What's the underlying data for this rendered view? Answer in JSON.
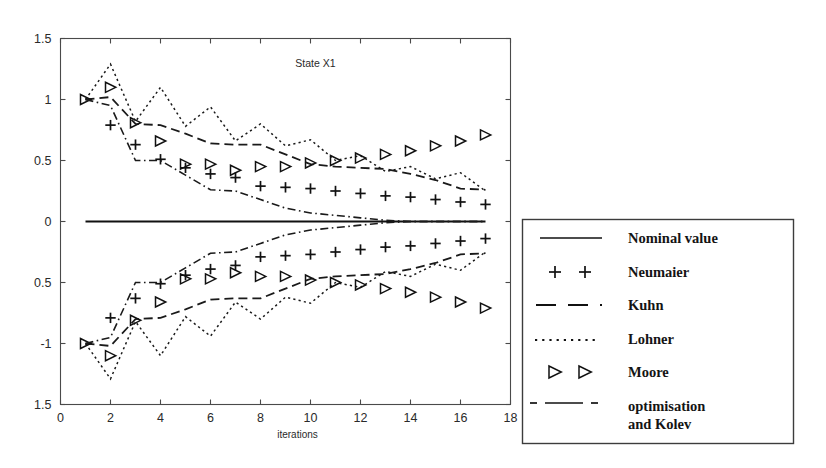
{
  "figure": {
    "title": "State X1",
    "xlabel": "iterations",
    "ylabel": ""
  },
  "chart_data": {
    "type": "line",
    "title": "State X1",
    "xlabel": "iterations",
    "ylabel": "",
    "xlim": [
      0,
      18
    ],
    "ylim": [
      -1.5,
      1.5
    ],
    "xticks": [
      0,
      2,
      4,
      6,
      8,
      10,
      12,
      14,
      16,
      18
    ],
    "xticklabels": [
      "0",
      "2",
      "4",
      "6",
      "8",
      "10",
      "12",
      "14",
      "16",
      "18"
    ],
    "yticks": [
      -1.5,
      -1.0,
      -0.5,
      0,
      0.5,
      1.0,
      1.5
    ],
    "yticklabels": [
      "1.5",
      "-1",
      "0.5",
      "0",
      "0.5",
      "1",
      "1.5"
    ],
    "grid": false,
    "legend_position": "outside-right",
    "x": [
      1,
      2,
      3,
      4,
      5,
      6,
      7,
      8,
      9,
      10,
      11,
      12,
      13,
      14,
      15,
      16,
      17
    ],
    "series": [
      {
        "name": "Nominal value",
        "style": "solid",
        "marker": "none",
        "values": [
          0,
          0,
          0,
          0,
          0,
          0,
          0,
          0,
          0,
          0,
          0,
          0,
          0,
          0,
          0,
          0,
          0
        ]
      },
      {
        "name": "Neumaier",
        "style": "none",
        "marker": "plus",
        "bound": "upper",
        "values": [
          1.0,
          0.79,
          0.63,
          0.51,
          0.44,
          0.39,
          0.36,
          0.29,
          0.28,
          0.27,
          0.25,
          0.23,
          0.21,
          0.2,
          0.18,
          0.16,
          0.14
        ]
      },
      {
        "name": "Neumaier",
        "style": "none",
        "marker": "plus",
        "bound": "lower",
        "values": [
          -1.0,
          -0.79,
          -0.63,
          -0.51,
          -0.44,
          -0.39,
          -0.36,
          -0.29,
          -0.28,
          -0.27,
          -0.25,
          -0.23,
          -0.21,
          -0.2,
          -0.18,
          -0.16,
          -0.14
        ]
      },
      {
        "name": "Kuhn",
        "style": "dashed",
        "marker": "none",
        "bound": "upper",
        "values": [
          1.0,
          1.02,
          0.8,
          0.79,
          0.72,
          0.64,
          0.63,
          0.63,
          0.55,
          0.47,
          0.45,
          0.44,
          0.43,
          0.39,
          0.34,
          0.27,
          0.26
        ]
      },
      {
        "name": "Kuhn",
        "style": "dashed",
        "marker": "none",
        "bound": "lower",
        "values": [
          -1.0,
          -1.02,
          -0.8,
          -0.79,
          -0.72,
          -0.64,
          -0.63,
          -0.63,
          -0.55,
          -0.47,
          -0.45,
          -0.44,
          -0.43,
          -0.39,
          -0.34,
          -0.27,
          -0.26
        ]
      },
      {
        "name": "Lohner",
        "style": "dotted",
        "marker": "none",
        "bound": "upper",
        "values": [
          1.0,
          1.29,
          0.82,
          1.1,
          0.78,
          0.94,
          0.66,
          0.8,
          0.62,
          0.67,
          0.5,
          0.54,
          0.41,
          0.45,
          0.35,
          0.4,
          0.25
        ]
      },
      {
        "name": "Lohner",
        "style": "dotted",
        "marker": "none",
        "bound": "lower",
        "values": [
          -1.0,
          -1.29,
          -0.82,
          -1.1,
          -0.78,
          -0.94,
          -0.66,
          -0.8,
          -0.62,
          -0.67,
          -0.5,
          -0.54,
          -0.41,
          -0.45,
          -0.35,
          -0.4,
          -0.25
        ]
      },
      {
        "name": "Moore",
        "style": "none",
        "marker": "triangle-right",
        "bound": "upper",
        "values": [
          1.0,
          1.1,
          0.81,
          0.66,
          0.47,
          0.47,
          0.42,
          0.45,
          0.45,
          0.48,
          0.5,
          0.52,
          0.55,
          0.58,
          0.62,
          0.66,
          0.71
        ]
      },
      {
        "name": "Moore",
        "style": "none",
        "marker": "triangle-right",
        "bound": "lower",
        "values": [
          -1.0,
          -1.1,
          -0.81,
          -0.66,
          -0.47,
          -0.47,
          -0.42,
          -0.45,
          -0.45,
          -0.48,
          -0.5,
          -0.52,
          -0.55,
          -0.58,
          -0.62,
          -0.66,
          -0.71
        ]
      },
      {
        "name": "optimisation and Kolev",
        "style": "dashdot",
        "marker": "none",
        "bound": "upper",
        "values": [
          1.0,
          0.95,
          0.5,
          0.5,
          0.38,
          0.26,
          0.25,
          0.18,
          0.11,
          0.07,
          0.05,
          0.03,
          0.01,
          0.0,
          0.0,
          0.0,
          0.0
        ]
      },
      {
        "name": "optimisation and Kolev",
        "style": "dashdot",
        "marker": "none",
        "bound": "lower",
        "values": [
          -1.0,
          -0.95,
          -0.5,
          -0.5,
          -0.38,
          -0.26,
          -0.25,
          -0.18,
          -0.11,
          -0.07,
          -0.05,
          -0.03,
          -0.01,
          0.0,
          0.0,
          0.0,
          0.0
        ]
      }
    ]
  },
  "legend": {
    "entries": [
      {
        "label": "Nominal value",
        "style": "solid",
        "marker": "none"
      },
      {
        "label": "Neumaier",
        "style": "none",
        "marker": "plus"
      },
      {
        "label": "Kuhn",
        "style": "dashed",
        "marker": "none"
      },
      {
        "label": "Lohner",
        "style": "dotted",
        "marker": "none"
      },
      {
        "label": "Moore",
        "style": "none",
        "marker": "triangle-right"
      },
      {
        "label": "optimisation",
        "label2": "and Kolev",
        "style": "dashdot",
        "marker": "none"
      }
    ]
  },
  "colors": {
    "ink": "#111111",
    "axis": "#4a4a4a",
    "background": "#ffffff"
  }
}
